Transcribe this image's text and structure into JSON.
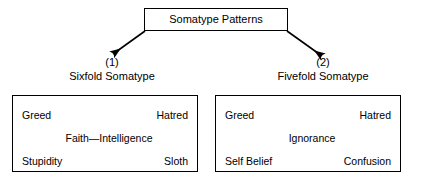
{
  "diagram": {
    "type": "tree",
    "root": {
      "label": "Somatype Patterns"
    },
    "branches": [
      {
        "number": "(1)",
        "title": "Sixfold Somatype",
        "panel": {
          "rows": [
            {
              "layout": "pair",
              "left": "Greed",
              "right": "Hatred"
            },
            {
              "layout": "center",
              "center": "Faith—Intelligence"
            },
            {
              "layout": "pair",
              "left": "Stupidity",
              "right": "Sloth"
            }
          ]
        }
      },
      {
        "number": "(2)",
        "title": "Fivefold Somatype",
        "panel": {
          "rows": [
            {
              "layout": "pair",
              "left": "Greed",
              "right": "Hatred"
            },
            {
              "layout": "center",
              "center": "Ignorance"
            },
            {
              "layout": "pair",
              "left": "Self Belief",
              "right": "Confusion"
            }
          ]
        }
      }
    ],
    "colors": {
      "stroke": "#000000",
      "background": "#ffffff",
      "text": "#000000"
    }
  }
}
